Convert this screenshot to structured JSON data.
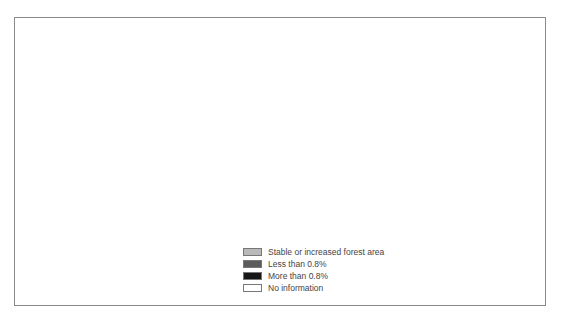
{
  "map": {
    "title": "",
    "type": "choropleth world map",
    "subject": "Annual change in forest area by country"
  },
  "legend": {
    "items": [
      {
        "label": "Stable or increased forest area",
        "color": "#b9b9b9"
      },
      {
        "label": "Less than 0.8%",
        "color": "#5b5b5b"
      },
      {
        "label": "More than 0.8%",
        "color": "#161616"
      },
      {
        "label": "No information",
        "color": "#ffffff"
      }
    ]
  },
  "colors": {
    "stable": "#b9b9b9",
    "less": "#5b5b5b",
    "more": "#161616",
    "none": "#ffffff",
    "outline": "#7a7a7a",
    "frame": "#8a8a8a"
  },
  "regions": {
    "stable_or_increased": [
      "Europe",
      "Russia",
      "Central Asia",
      "Australia",
      "Korea",
      "Morocco/Western Sahara",
      "Mali/Niger region"
    ],
    "less_than_0_8": [
      "Alaska",
      "United States",
      "Brazil",
      "Peru",
      "Colombia",
      "Central/East Africa",
      "Madagascar",
      "India",
      "Japan",
      "Myanmar region"
    ],
    "more_than_0_8": [
      "Mexico",
      "Central America",
      "Caribbean",
      "Venezuela",
      "Bolivia/Paraguay",
      "West Africa",
      "Sudan",
      "Tanzania/Zambia",
      "Pakistan",
      "Southeast Asia",
      "Indonesia",
      "Papua New Guinea"
    ],
    "no_information": [
      "Canada",
      "Greenland",
      "North Africa",
      "Middle East",
      "China",
      "Mongolia",
      "Argentina",
      "Chile",
      "South Africa",
      "New Zealand"
    ]
  }
}
